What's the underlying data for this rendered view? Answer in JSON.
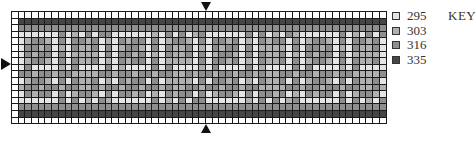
{
  "chart_data": {
    "type": "heatmap",
    "title": "",
    "grid": {
      "columns": 56,
      "rows": 17
    },
    "legend_title": "KEY",
    "legend": [
      {
        "code": "295",
        "color": "#e4e4e4"
      },
      {
        "code": "303",
        "color": "#b0b0b0"
      },
      {
        "code": "316",
        "color": "#8e8e8e"
      },
      {
        "code": "335",
        "color": "#454545"
      }
    ],
    "row_bands": [
      {
        "rows": [
          0
        ],
        "code": "blank"
      },
      {
        "rows": [
          1
        ],
        "code": "335"
      },
      {
        "rows": [
          2
        ],
        "code": "316"
      },
      {
        "rows": [
          3,
          13
        ],
        "code": "pattern 295/303 on 316"
      },
      {
        "rows": [
          14
        ],
        "code": "316"
      },
      {
        "rows": [
          15
        ],
        "code": "335"
      },
      {
        "rows": [
          16
        ],
        "code": "blank"
      }
    ],
    "center_markers": [
      "top",
      "bottom",
      "left"
    ]
  },
  "legend": {
    "title": "KEY",
    "items": [
      {
        "label": "295",
        "color": "#e4e4e4"
      },
      {
        "label": "303",
        "color": "#b0b0b0"
      },
      {
        "label": "316",
        "color": "#8e8e8e"
      },
      {
        "label": "335",
        "color": "#454545"
      }
    ]
  }
}
